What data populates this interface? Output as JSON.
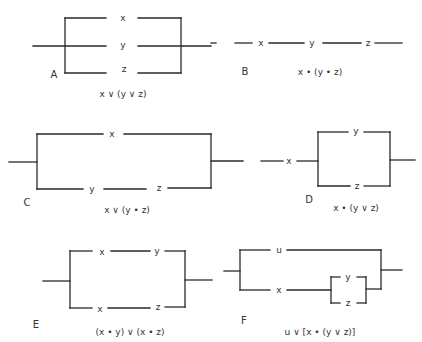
{
  "figure": {
    "panels": [
      {
        "id": "A",
        "label": "A",
        "switches": [
          "x",
          "y",
          "z"
        ],
        "expression": "x ∨ (y ∨ z)",
        "description": "three switches in parallel"
      },
      {
        "id": "B",
        "label": "B",
        "switches": [
          "x",
          "y",
          "z"
        ],
        "expression": "x • (y • z)",
        "description": "three switches in series"
      },
      {
        "id": "C",
        "label": "C",
        "switches": [
          "x",
          "y",
          "z"
        ],
        "expression": "x ∨ (y • z)",
        "description": "x in parallel with series y, z"
      },
      {
        "id": "D",
        "label": "D",
        "switches": [
          "x",
          "y",
          "z"
        ],
        "expression": "x • (y ∨ z)",
        "description": "x in series with parallel y, z"
      },
      {
        "id": "E",
        "label": "E",
        "switches": [
          "x",
          "y",
          "x",
          "z"
        ],
        "expression": "(x • y) ∨ (x • z)",
        "description": "series x,y in parallel with series x,z"
      },
      {
        "id": "F",
        "label": "F",
        "switches": [
          "u",
          "x",
          "y",
          "z"
        ],
        "expression": "u ∨ [x • (y ∨ z)]",
        "description": "u in parallel with x in series with parallel y,z"
      }
    ]
  }
}
